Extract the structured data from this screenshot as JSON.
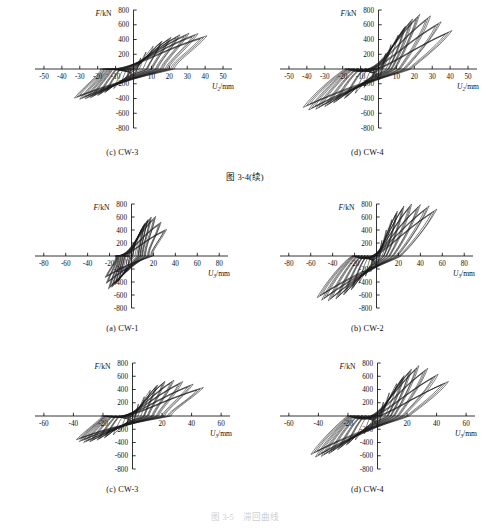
{
  "figure": {
    "middle_caption": "图 3-4(续)",
    "bottom_caption": "图 3-5　滞回曲线"
  },
  "axis": {
    "ylabel_main": "F",
    "ylabel_unit": "/kN",
    "xlabel_main": "U",
    "xlabel_sub": "2",
    "xlabel_sub_alt": "3",
    "xlabel_unit": "/mm"
  },
  "panels": [
    {
      "caption": "(c) CW-3",
      "row": 1,
      "xticks": [
        -50,
        -40,
        -30,
        -20,
        -10,
        0,
        10,
        20,
        30,
        40,
        50
      ],
      "yticks": [
        -800,
        -600,
        -400,
        -200,
        0,
        200,
        400,
        600,
        800
      ],
      "xsub": "2"
    },
    {
      "caption": "(d) CW-4",
      "row": 1,
      "xticks": [
        -50,
        -40,
        -30,
        -20,
        -10,
        0,
        10,
        20,
        30,
        40,
        50
      ],
      "yticks": [
        -800,
        -600,
        -400,
        -200,
        0,
        200,
        400,
        600,
        800
      ],
      "xsub": "2"
    },
    {
      "caption": "(a) CW-1",
      "row": 2,
      "xticks": [
        -80,
        -60,
        -40,
        -20,
        0,
        20,
        40,
        60,
        80
      ],
      "yticks": [
        -800,
        -600,
        -400,
        -200,
        0,
        200,
        400,
        600,
        800
      ],
      "xsub": "3"
    },
    {
      "caption": "(b) CW-2",
      "row": 2,
      "xticks": [
        -80,
        -60,
        -40,
        -20,
        0,
        20,
        40,
        60,
        80
      ],
      "yticks": [
        -800,
        -600,
        -400,
        -200,
        0,
        200,
        400,
        600,
        800
      ],
      "xsub": "3"
    },
    {
      "caption": "(c) CW-3",
      "row": 3,
      "xticks": [
        -60,
        -40,
        -20,
        0,
        20,
        40,
        60
      ],
      "yticks": [
        -800,
        -600,
        -400,
        -200,
        0,
        200,
        400,
        600,
        800
      ],
      "xsub": "3"
    },
    {
      "caption": "(d) CW-4",
      "row": 3,
      "xticks": [
        -60,
        -40,
        -20,
        0,
        20,
        40,
        60
      ],
      "yticks": [
        -800,
        -600,
        -400,
        -200,
        0,
        200,
        400,
        600,
        800
      ],
      "xsub": "3"
    }
  ],
  "chart_data": [
    {
      "id": "r1c1",
      "type": "line",
      "title": "(c) CW-3",
      "xlabel": "U2/mm",
      "ylabel": "F/kN",
      "xlim": [
        -55,
        55
      ],
      "ylim": [
        -800,
        800
      ],
      "grid": false,
      "legend": "none",
      "description": "Hysteresis loops, slender spindle shape, positive peaks to ~500 kN at ~40 mm, negative peaks to ~-420 kN at ~-32 mm",
      "series": [
        {
          "name": "cycle-1",
          "peak_pos": [
            4,
            150
          ],
          "peak_neg": [
            -4,
            -130
          ]
        },
        {
          "name": "cycle-2",
          "peak_pos": [
            7,
            230
          ],
          "peak_neg": [
            -7,
            -200
          ]
        },
        {
          "name": "cycle-3",
          "peak_pos": [
            11,
            310
          ],
          "peak_neg": [
            -11,
            -265
          ]
        },
        {
          "name": "cycle-4",
          "peak_pos": [
            16,
            380
          ],
          "peak_neg": [
            -16,
            -320
          ]
        },
        {
          "name": "cycle-5",
          "peak_pos": [
            21,
            430
          ],
          "peak_neg": [
            -20,
            -360
          ]
        },
        {
          "name": "cycle-6",
          "peak_pos": [
            26,
            465
          ],
          "peak_neg": [
            -24,
            -390
          ]
        },
        {
          "name": "cycle-7",
          "peak_pos": [
            31,
            485
          ],
          "peak_neg": [
            -27,
            -405
          ]
        },
        {
          "name": "cycle-8",
          "peak_pos": [
            36,
            480
          ],
          "peak_neg": [
            -30,
            -410
          ]
        },
        {
          "name": "cycle-9",
          "peak_pos": [
            41,
            450
          ],
          "peak_neg": [
            -33,
            -395
          ]
        }
      ]
    },
    {
      "id": "r1c2",
      "type": "line",
      "title": "(d) CW-4",
      "xlabel": "U2/mm",
      "ylabel": "F/kN",
      "xlim": [
        -55,
        55
      ],
      "ylim": [
        -800,
        800
      ],
      "grid": false,
      "legend": "none",
      "description": "Hysteresis loops, fatter spindle shape, positive peaks to ~740 kN at ~22 mm, negative peaks to ~-560 kN at ~-40 mm",
      "series": [
        {
          "name": "cycle-1",
          "peak_pos": [
            4,
            210
          ],
          "peak_neg": [
            -4,
            -160
          ]
        },
        {
          "name": "cycle-2",
          "peak_pos": [
            7,
            330
          ],
          "peak_neg": [
            -8,
            -250
          ]
        },
        {
          "name": "cycle-3",
          "peak_pos": [
            11,
            460
          ],
          "peak_neg": [
            -13,
            -330
          ]
        },
        {
          "name": "cycle-4",
          "peak_pos": [
            15,
            580
          ],
          "peak_neg": [
            -19,
            -400
          ]
        },
        {
          "name": "cycle-5",
          "peak_pos": [
            19,
            680
          ],
          "peak_neg": [
            -25,
            -460
          ]
        },
        {
          "name": "cycle-6",
          "peak_pos": [
            23,
            740
          ],
          "peak_neg": [
            -30,
            -510
          ]
        },
        {
          "name": "cycle-7",
          "peak_pos": [
            29,
            720
          ],
          "peak_neg": [
            -35,
            -545
          ]
        },
        {
          "name": "cycle-8",
          "peak_pos": [
            35,
            640
          ],
          "peak_neg": [
            -39,
            -555
          ]
        },
        {
          "name": "cycle-9",
          "peak_pos": [
            41,
            520
          ],
          "peak_neg": [
            -42,
            -520
          ]
        }
      ]
    },
    {
      "id": "r2c1",
      "type": "line",
      "title": "(a) CW-1",
      "xlabel": "U3/mm",
      "ylabel": "F/kN",
      "xlim": [
        -88,
        88
      ],
      "ylim": [
        -800,
        800
      ],
      "grid": false,
      "legend": "none",
      "description": "Pinched hysteresis loops concentrated near origin, positive peaks to ~610 kN at ~22 mm, negative peaks to ~-510 kN at ~-22 mm, narrow slender loops",
      "series": [
        {
          "name": "cycle-1",
          "peak_pos": [
            3,
            180
          ],
          "peak_neg": [
            -3,
            -150
          ]
        },
        {
          "name": "cycle-2",
          "peak_pos": [
            6,
            300
          ],
          "peak_neg": [
            -6,
            -240
          ]
        },
        {
          "name": "cycle-3",
          "peak_pos": [
            9,
            410
          ],
          "peak_neg": [
            -9,
            -320
          ]
        },
        {
          "name": "cycle-4",
          "peak_pos": [
            12,
            500
          ],
          "peak_neg": [
            -12,
            -390
          ]
        },
        {
          "name": "cycle-5",
          "peak_pos": [
            15,
            560
          ],
          "peak_neg": [
            -15,
            -440
          ]
        },
        {
          "name": "cycle-6",
          "peak_pos": [
            18,
            600
          ],
          "peak_neg": [
            -18,
            -480
          ]
        },
        {
          "name": "cycle-7",
          "peak_pos": [
            22,
            610
          ],
          "peak_neg": [
            -21,
            -505
          ]
        },
        {
          "name": "cycle-8",
          "peak_pos": [
            27,
            520
          ],
          "peak_neg": [
            -23,
            -420
          ]
        },
        {
          "name": "cycle-9",
          "peak_pos": [
            32,
            410
          ],
          "peak_neg": [
            -24,
            -330
          ]
        }
      ]
    },
    {
      "id": "r2c2",
      "type": "line",
      "title": "(b) CW-2",
      "xlabel": "U3/mm",
      "ylabel": "F/kN",
      "xlim": [
        -88,
        88
      ],
      "ylim": [
        -800,
        800
      ],
      "grid": false,
      "legend": "none",
      "description": "Full fat hysteresis loops, positive peaks to ~800 kN at ~32 mm, negative peaks to ~-690 kN at ~-52 mm, wide energy dissipation area",
      "series": [
        {
          "name": "cycle-1",
          "peak_pos": [
            5,
            240
          ],
          "peak_neg": [
            -5,
            -190
          ]
        },
        {
          "name": "cycle-2",
          "peak_pos": [
            9,
            400
          ],
          "peak_neg": [
            -10,
            -310
          ]
        },
        {
          "name": "cycle-3",
          "peak_pos": [
            14,
            560
          ],
          "peak_neg": [
            -16,
            -420
          ]
        },
        {
          "name": "cycle-4",
          "peak_pos": [
            19,
            690
          ],
          "peak_neg": [
            -23,
            -520
          ]
        },
        {
          "name": "cycle-5",
          "peak_pos": [
            25,
            770
          ],
          "peak_neg": [
            -30,
            -600
          ]
        },
        {
          "name": "cycle-6",
          "peak_pos": [
            32,
            800
          ],
          "peak_neg": [
            -37,
            -660
          ]
        },
        {
          "name": "cycle-7",
          "peak_pos": [
            40,
            790
          ],
          "peak_neg": [
            -44,
            -690
          ]
        },
        {
          "name": "cycle-8",
          "peak_pos": [
            48,
            770
          ],
          "peak_neg": [
            -50,
            -680
          ]
        },
        {
          "name": "cycle-9",
          "peak_pos": [
            55,
            720
          ],
          "peak_neg": [
            -54,
            -640
          ]
        }
      ]
    },
    {
      "id": "r3c1",
      "type": "line",
      "title": "(c) CW-3",
      "xlabel": "U3/mm",
      "ylabel": "F/kN",
      "xlim": [
        -66,
        66
      ],
      "ylim": [
        -800,
        800
      ],
      "grid": false,
      "legend": "none",
      "description": "Slender spindle hysteresis loops, positive peaks to ~540 kN at ~25 mm, negative peaks to ~-400 kN at ~-38 mm",
      "series": [
        {
          "name": "cycle-1",
          "peak_pos": [
            4,
            180
          ],
          "peak_neg": [
            -4,
            -140
          ]
        },
        {
          "name": "cycle-2",
          "peak_pos": [
            8,
            290
          ],
          "peak_neg": [
            -8,
            -220
          ]
        },
        {
          "name": "cycle-3",
          "peak_pos": [
            12,
            390
          ],
          "peak_neg": [
            -13,
            -285
          ]
        },
        {
          "name": "cycle-4",
          "peak_pos": [
            17,
            470
          ],
          "peak_neg": [
            -19,
            -330
          ]
        },
        {
          "name": "cycle-5",
          "peak_pos": [
            22,
            525
          ],
          "peak_neg": [
            -24,
            -365
          ]
        },
        {
          "name": "cycle-6",
          "peak_pos": [
            28,
            540
          ],
          "peak_neg": [
            -29,
            -390
          ]
        },
        {
          "name": "cycle-7",
          "peak_pos": [
            34,
            520
          ],
          "peak_neg": [
            -33,
            -400
          ]
        },
        {
          "name": "cycle-8",
          "peak_pos": [
            41,
            480
          ],
          "peak_neg": [
            -36,
            -385
          ]
        },
        {
          "name": "cycle-9",
          "peak_pos": [
            48,
            430
          ],
          "peak_neg": [
            -38,
            -360
          ]
        }
      ]
    },
    {
      "id": "r3c2",
      "type": "line",
      "title": "(d) CW-4",
      "xlabel": "U3/mm",
      "ylabel": "F/kN",
      "xlim": [
        -66,
        66
      ],
      "ylim": [
        -800,
        800
      ],
      "grid": false,
      "legend": "none",
      "description": "Fat spindle hysteresis loops, positive peaks to ~760 kN at ~28 mm, negative peaks to ~-620 kN at ~-42 mm",
      "series": [
        {
          "name": "cycle-1",
          "peak_pos": [
            4,
            210
          ],
          "peak_neg": [
            -4,
            -170
          ]
        },
        {
          "name": "cycle-2",
          "peak_pos": [
            8,
            350
          ],
          "peak_neg": [
            -9,
            -270
          ]
        },
        {
          "name": "cycle-3",
          "peak_pos": [
            13,
            490
          ],
          "peak_neg": [
            -15,
            -360
          ]
        },
        {
          "name": "cycle-4",
          "peak_pos": [
            18,
            610
          ],
          "peak_neg": [
            -21,
            -440
          ]
        },
        {
          "name": "cycle-5",
          "peak_pos": [
            23,
            710
          ],
          "peak_neg": [
            -27,
            -510
          ]
        },
        {
          "name": "cycle-6",
          "peak_pos": [
            28,
            760
          ],
          "peak_neg": [
            -33,
            -570
          ]
        },
        {
          "name": "cycle-7",
          "peak_pos": [
            34,
            720
          ],
          "peak_neg": [
            -38,
            -610
          ]
        },
        {
          "name": "cycle-8",
          "peak_pos": [
            41,
            630
          ],
          "peak_neg": [
            -42,
            -620
          ]
        },
        {
          "name": "cycle-9",
          "peak_pos": [
            48,
            520
          ],
          "peak_neg": [
            -45,
            -580
          ]
        }
      ]
    }
  ]
}
